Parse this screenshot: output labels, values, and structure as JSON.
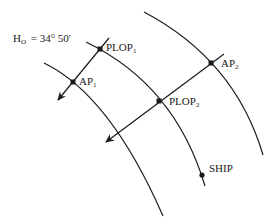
{
  "diagram": {
    "title_label": {
      "main": "H",
      "sub": "O",
      "value": "= 34° 50'"
    },
    "points": {
      "plop1": {
        "main": "PLOP",
        "sub": "1"
      },
      "ap1": {
        "main": "AP",
        "sub": "1"
      },
      "ap2": {
        "main": "AP",
        "sub": "2"
      },
      "plop2": {
        "main": "PLOP",
        "sub": "2"
      },
      "ship": {
        "main": "SHIP",
        "sub": ""
      }
    },
    "colors": {
      "line": "#1a1a1a",
      "background": "#ffffff"
    }
  }
}
